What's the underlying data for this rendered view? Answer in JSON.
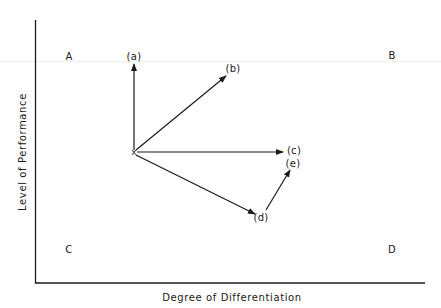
{
  "diagram": {
    "x_axis_label": "Degree of Differentiation",
    "y_axis_label": "Level of Performance",
    "origin_marker": "x",
    "quadrants": {
      "top_left": "A",
      "top_right": "B",
      "bottom_left": "C",
      "bottom_right": "D"
    },
    "arrows": [
      {
        "id": "a",
        "label": "(a)",
        "from": "x",
        "direction": "up"
      },
      {
        "id": "b",
        "label": "(b)",
        "from": "x",
        "direction": "up-right"
      },
      {
        "id": "c",
        "label": "(c)",
        "from": "x",
        "direction": "right"
      },
      {
        "id": "d",
        "label": "(d)",
        "from": "x",
        "direction": "down-right"
      },
      {
        "id": "e",
        "label": "(e)",
        "from": "(d)",
        "direction": "up-right"
      }
    ],
    "colors": {
      "ink": "#1a1a1a",
      "background": "#ffffff"
    }
  }
}
